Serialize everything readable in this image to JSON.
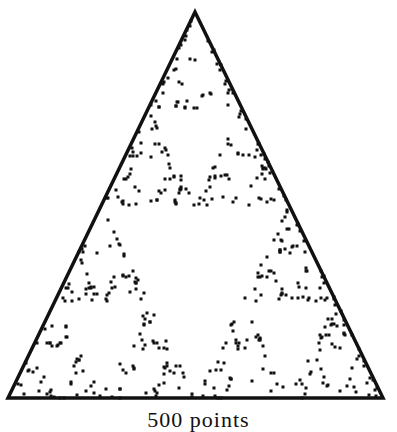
{
  "figure": {
    "type": "sierpinski-chaos-game",
    "triangle": {
      "apex": [
        195,
        12
      ],
      "bottom_left": [
        8,
        398
      ],
      "bottom_right": [
        383,
        398
      ],
      "stroke_color": "#111111",
      "stroke_width": 3.5
    },
    "points": {
      "count": 500,
      "color": "#111111",
      "dot_size": 3,
      "seed": 7
    }
  },
  "caption": {
    "text": "500 points"
  }
}
